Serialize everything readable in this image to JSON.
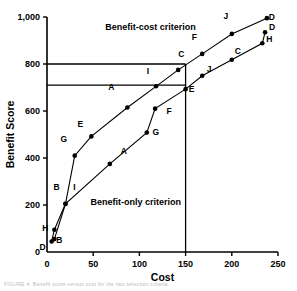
{
  "chart_data": {
    "type": "line",
    "title": "",
    "xlabel": "Cost",
    "ylabel": "Benefit Score",
    "xlim": [
      0,
      250
    ],
    "ylim": [
      0,
      1000
    ],
    "xticks": [
      "0",
      "50",
      "100",
      "150",
      "200",
      "250"
    ],
    "xtick_values": [
      0,
      50,
      100,
      150,
      200,
      250
    ],
    "yticks": [
      "0",
      "200",
      "400",
      "600",
      "800",
      "1,000"
    ],
    "ytick_values": [
      0,
      200,
      400,
      600,
      800,
      1000
    ],
    "grid": false,
    "legend_position": "inline-annotations",
    "annotations": [
      {
        "name": "benefit-cost-label",
        "text": "Benefit-cost criterion",
        "x": 112,
        "y": 945
      },
      {
        "name": "benefit-only-label",
        "text": "Benefit-only criterion",
        "x": 96,
        "y": 200
      }
    ],
    "reference_lines": [
      {
        "name": "ref-line-800",
        "type": "horizontal",
        "y": 800,
        "x_from": 0,
        "x_to": 150
      },
      {
        "name": "ref-line-710",
        "type": "horizontal",
        "y": 710,
        "x_from": 0,
        "x_to": 150
      },
      {
        "name": "ref-line-150",
        "type": "vertical",
        "x": 150,
        "y_from": 0,
        "y_to": 800
      }
    ],
    "series": [
      {
        "name": "Benefit-cost criterion",
        "points": [
          {
            "label": "D",
            "x": 5,
            "y": 45,
            "lx": -9,
            "ly": 9
          },
          {
            "label": "H",
            "x": 8,
            "y": 95,
            "lx": -9,
            "ly": 1
          },
          {
            "label": "B",
            "x": 20,
            "y": 205,
            "lx": -9,
            "ly": -14
          },
          {
            "label": "G",
            "x": 30,
            "y": 410,
            "lx": -11,
            "ly": -14
          },
          {
            "label": "E",
            "x": 48,
            "y": 492,
            "lx": -11,
            "ly": -9
          },
          {
            "label": "A",
            "x": 87,
            "y": 615,
            "lx": -16,
            "ly": -17
          },
          {
            "label": "I",
            "x": 118,
            "y": 705,
            "lx": -8,
            "ly": -12
          },
          {
            "label": "C",
            "x": 142,
            "y": 775,
            "lx": 3,
            "ly": -13
          },
          {
            "label": "F",
            "x": 168,
            "y": 843,
            "lx": -8,
            "ly": -14
          },
          {
            "label": "J",
            "x": 200,
            "y": 928,
            "lx": -6,
            "ly": -15
          },
          {
            "label": "D",
            "x": 238,
            "y": 995,
            "lx": 5,
            "ly": 2
          }
        ]
      },
      {
        "name": "Benefit-only criterion",
        "points": [
          {
            "label": "B",
            "x": 8,
            "y": 55,
            "lx": 5,
            "ly": 4
          },
          {
            "label": "I",
            "x": 20,
            "y": 205,
            "lx": 9,
            "ly": -14
          },
          {
            "label": "A",
            "x": 68,
            "y": 375,
            "lx": 14,
            "ly": -10
          },
          {
            "label": "G",
            "x": 108,
            "y": 508,
            "lx": 9,
            "ly": 2
          },
          {
            "label": "F",
            "x": 117,
            "y": 610,
            "lx": 14,
            "ly": 5
          },
          {
            "label": "E",
            "x": 150,
            "y": 693,
            "lx": 6,
            "ly": 3
          },
          {
            "label": "J",
            "x": 168,
            "y": 750,
            "lx": 7,
            "ly": -4
          },
          {
            "label": "C",
            "x": 200,
            "y": 818,
            "lx": 6,
            "ly": -6
          },
          {
            "label": "H",
            "x": 233,
            "y": 888,
            "lx": 7,
            "ly": -1
          },
          {
            "label": "D",
            "x": 236,
            "y": 935,
            "lx": 7,
            "ly": -2
          }
        ]
      }
    ]
  },
  "caption": {
    "fragment": "FIGURE 4.   Benefit score versus cost for the two selection criteria."
  }
}
